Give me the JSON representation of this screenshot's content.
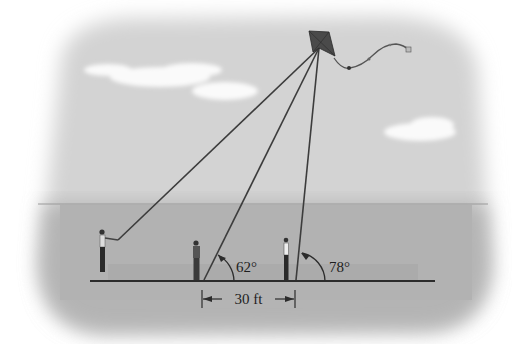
{
  "diagram": {
    "type": "kite-angle-of-elevation",
    "angle_left_label": "62°",
    "angle_right_label": "78°",
    "distance_label": "30 ft",
    "angle_left_value": 62,
    "angle_right_value": 78,
    "distance_value": 30,
    "distance_unit": "ft"
  },
  "colors": {
    "sky": "#d4d4d4",
    "ground": "#b3b3b3",
    "cloud": "#fafafa",
    "line": "#3a3a3a",
    "kite": "#4a4a4a"
  }
}
